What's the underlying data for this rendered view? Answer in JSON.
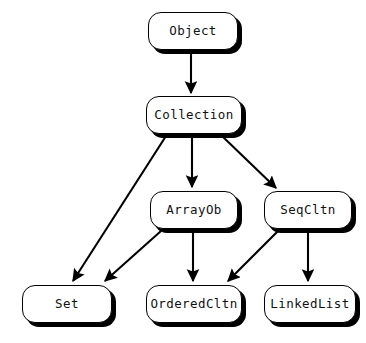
{
  "diagram": {
    "type": "class-hierarchy-graph",
    "background_color": "#ffffff",
    "node_fill_color": "#ffffff",
    "node_border_color": "#000000",
    "node_shadow_color": "#000000",
    "edge_color": "#000000",
    "text_color": "#111111",
    "nodes": [
      {
        "id": "object",
        "label": "Object",
        "x": 148,
        "y": 12,
        "w": 90,
        "h": 38
      },
      {
        "id": "collection",
        "label": "Collection",
        "x": 146,
        "y": 96,
        "w": 96,
        "h": 38
      },
      {
        "id": "arrayob",
        "label": "ArrayOb",
        "x": 150,
        "y": 191,
        "w": 88,
        "h": 38
      },
      {
        "id": "seqcltn",
        "label": "SeqCltn",
        "x": 264,
        "y": 191,
        "w": 88,
        "h": 38
      },
      {
        "id": "set",
        "label": "Set",
        "x": 22,
        "y": 285,
        "w": 90,
        "h": 38
      },
      {
        "id": "orderedcltn",
        "label": "OrderedCltn",
        "x": 146,
        "y": 285,
        "w": 96,
        "h": 38
      },
      {
        "id": "linkedlist",
        "label": "LinkedList",
        "x": 264,
        "y": 285,
        "w": 92,
        "h": 38
      }
    ],
    "edges": [
      {
        "id": "object-to-collection",
        "from": "Object",
        "to": "Collection",
        "x1": 191,
        "y1": 51,
        "x2": 191,
        "y2": 93
      },
      {
        "id": "collection-to-set",
        "from": "Collection",
        "to": "Set",
        "x1": 166,
        "y1": 136,
        "x2": 73,
        "y2": 281
      },
      {
        "id": "collection-to-arrayob",
        "from": "Collection",
        "to": "ArrayOb",
        "x1": 192,
        "y1": 136,
        "x2": 192,
        "y2": 187
      },
      {
        "id": "collection-to-seqcltn",
        "from": "Collection",
        "to": "SeqCltn",
        "x1": 222,
        "y1": 136,
        "x2": 276,
        "y2": 188
      },
      {
        "id": "arrayob-to-set",
        "from": "ArrayOb",
        "to": "Set",
        "x1": 161,
        "y1": 231,
        "x2": 105,
        "y2": 281
      },
      {
        "id": "arrayob-to-orderedcltn",
        "from": "ArrayOb",
        "to": "OrderedCltn",
        "x1": 193,
        "y1": 231,
        "x2": 193,
        "y2": 281
      },
      {
        "id": "seqcltn-to-orderedcltn",
        "from": "SeqCltn",
        "to": "OrderedCltn",
        "x1": 278,
        "y1": 231,
        "x2": 228,
        "y2": 281
      },
      {
        "id": "seqcltn-to-linkedlist",
        "from": "SeqCltn",
        "to": "LinkedList",
        "x1": 308,
        "y1": 231,
        "x2": 308,
        "y2": 281
      }
    ]
  }
}
